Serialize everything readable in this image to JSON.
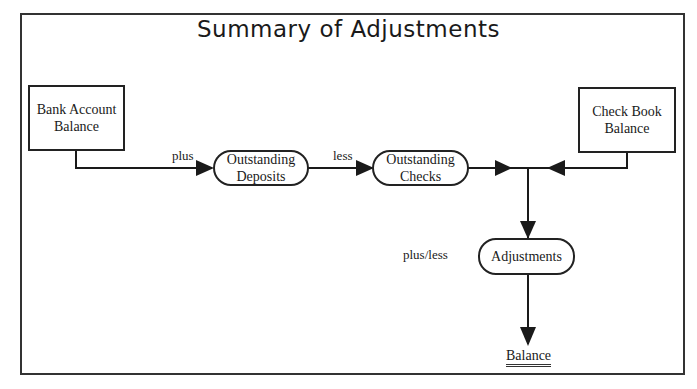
{
  "title": "Summary of Adjustments",
  "nodes": {
    "bank_account_balance": {
      "line1": "Bank Account",
      "line2": "Balance"
    },
    "check_book_balance": {
      "line1": "Check Book",
      "line2": "Balance"
    },
    "outstanding_deposits": {
      "line1": "Outstanding",
      "line2": "Deposits"
    },
    "outstanding_checks": {
      "line1": "Outstanding",
      "line2": "Checks"
    },
    "adjustments": {
      "label": "Adjustments"
    },
    "balance": {
      "label": "Balance"
    }
  },
  "edge_labels": {
    "plus": "plus",
    "less": "less",
    "plus_less": "plus/less"
  },
  "colors": {
    "line": "#1a1a1a",
    "background": "#ffffff"
  }
}
